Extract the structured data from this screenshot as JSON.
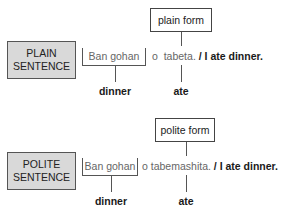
{
  "plain": {
    "label_line1": "PLAIN",
    "label_line2": "SENTENCE",
    "form_label": "plain form",
    "bracketed_text": "Ban gohan",
    "particle": "o",
    "verb": "tabeta.",
    "separator": "/",
    "translation": "I ate dinner.",
    "gloss_noun": "dinner",
    "gloss_verb": "ate"
  },
  "polite": {
    "label_line1": "POLITE",
    "label_line2": "SENTENCE",
    "form_label": "polite form",
    "bracketed_text": "Ban gohan",
    "particle": "o",
    "verb": "tabemashita.",
    "separator": "/",
    "translation": "I ate dinner.",
    "gloss_noun": "dinner",
    "gloss_verb": "ate"
  }
}
